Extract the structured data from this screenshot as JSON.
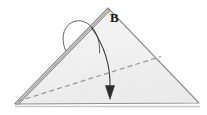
{
  "figure": {
    "name": "folded-triangle-diagram",
    "type": "geometry-fold-diagram",
    "background_color": "#ffffff",
    "labels": [
      {
        "id": "B",
        "text": "B",
        "x": 110,
        "y": 11
      }
    ],
    "colors": {
      "face_fill": "#f2f2f2",
      "face_fill_shaded": "#ececec",
      "outline": "#8c8c8c",
      "outline_dark": "#6e6e6e",
      "dashed_line": "#9a9a9a",
      "arrow": "#3a3a3a",
      "label_text": "#1a1a1a",
      "baseline_shadow": "#c9c9c9"
    },
    "shapes": {
      "main_triangle": {
        "name": "main-triangle-face",
        "points": "108,8 199,103 15,104",
        "description": "large light-gray triangle"
      },
      "fold_flap": {
        "name": "fold-flap-edge",
        "points": "108,8 15,104 18,104 110,10",
        "description": "narrow double-line fold edge along upper-left side"
      },
      "dashed_crease": {
        "name": "dashed-crease-line",
        "from": [
          18,
          101
        ],
        "to": [
          161,
          57
        ],
        "dash_pattern": "5 3"
      },
      "loop_arc": {
        "name": "fold-loop-arc",
        "path": "M 65,50 C 58,30 72,18 84,22 C 96,26 100,40 99,52",
        "description": "curved loop arc over the left fold edge"
      },
      "motion_arrow": {
        "name": "fold-motion-arrow",
        "path": "M 92,28 C 106,48 110,68 110,90",
        "head_points": "110,99 105,86 115,86",
        "description": "curved arrow from apex region sweeping down to base"
      },
      "baseline": {
        "name": "base-shadow-line",
        "from": [
          15,
          106
        ],
        "to": [
          200,
          106
        ]
      }
    }
  }
}
